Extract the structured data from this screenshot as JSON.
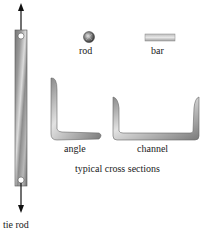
{
  "diagram": {
    "tie_rod": {
      "label": "tie rod",
      "arrows": [
        "up",
        "down"
      ]
    },
    "cross_sections": {
      "caption": "typical cross sections",
      "items": [
        {
          "id": "rod",
          "label": "rod"
        },
        {
          "id": "bar",
          "label": "bar"
        },
        {
          "id": "angle",
          "label": "angle"
        },
        {
          "id": "channel",
          "label": "channel"
        }
      ]
    },
    "colors": {
      "metal_dark": "#6e6e6e",
      "metal_light": "#d8d8d8",
      "arrow": "#111111"
    }
  }
}
